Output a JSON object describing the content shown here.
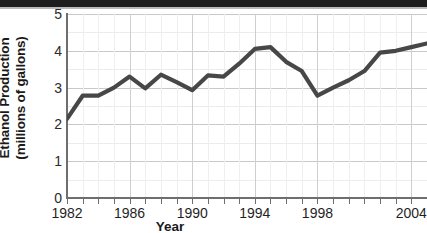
{
  "chart_data": {
    "type": "line",
    "title": "",
    "xlabel": "Year",
    "ylabel": "Ethanol Production (millions of gallons)",
    "ylabel_line1": "Ethanol Production",
    "ylabel_line2": "(millions of gallons)",
    "ylim": [
      0,
      5
    ],
    "xlim": [
      1982,
      2005
    ],
    "grid": true,
    "legend": false,
    "line_color": "#474747",
    "gridline_color": "#c9c9c9",
    "background_color": "#ffffff",
    "axis_color": "#6e6e6e",
    "y_ticks": [
      0,
      1,
      2,
      3,
      4,
      5
    ],
    "y_tick_labels": [
      "0",
      "1",
      "2",
      "3",
      "4",
      "5"
    ],
    "y_minor_ticks": [
      0.5,
      1.5,
      2.5,
      3.5,
      4.5
    ],
    "x_ticks": [
      1982,
      1983,
      1984,
      1985,
      1986,
      1987,
      1988,
      1989,
      1990,
      1991,
      1992,
      1993,
      1994,
      1995,
      1996,
      1997,
      1998,
      1999,
      2000,
      2001,
      2002,
      2003,
      2004,
      2005
    ],
    "x_tick_labels": [
      "1982",
      "1986",
      "1990",
      "1994",
      "1998",
      "2004"
    ],
    "x_labeled_years": [
      1982,
      1986,
      1990,
      1994,
      1998,
      2004
    ],
    "x": [
      1982,
      1983,
      1984,
      1985,
      1986,
      1987,
      1988,
      1989,
      1990,
      1991,
      1992,
      1993,
      1994,
      1995,
      1996,
      1997,
      1998,
      1999,
      2000,
      2001,
      2002,
      2003,
      2004,
      2005
    ],
    "values": [
      2.15,
      2.78,
      2.78,
      3.0,
      3.3,
      2.98,
      3.35,
      3.15,
      2.93,
      3.33,
      3.3,
      3.65,
      4.05,
      4.1,
      3.7,
      3.45,
      2.78,
      3.0,
      3.2,
      3.45,
      3.95,
      4.0,
      4.1,
      4.2
    ],
    "series": [
      {
        "name": "Ethanol Production",
        "values": [
          2.15,
          2.78,
          2.78,
          3.0,
          3.3,
          2.98,
          3.35,
          3.15,
          2.93,
          3.33,
          3.3,
          3.65,
          4.05,
          4.1,
          3.7,
          3.45,
          2.78,
          3.0,
          3.2,
          3.45,
          3.95,
          4.0,
          4.1,
          4.2
        ]
      }
    ]
  }
}
